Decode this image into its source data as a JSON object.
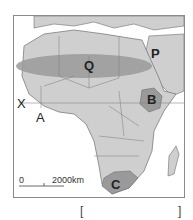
{
  "map": {
    "labels": {
      "Q": "Q",
      "P": "P",
      "B": "B",
      "C": "C",
      "A": "A",
      "X": "X"
    },
    "scale_bar": {
      "start": "0",
      "end": "2000km"
    },
    "colors": {
      "land": "#cfcfcf",
      "highlight_region": "#9a9a9a",
      "border": "#6f6f6f",
      "sea": "#ffffff"
    }
  },
  "answer_brackets": {
    "left": "[",
    "right": "]"
  }
}
